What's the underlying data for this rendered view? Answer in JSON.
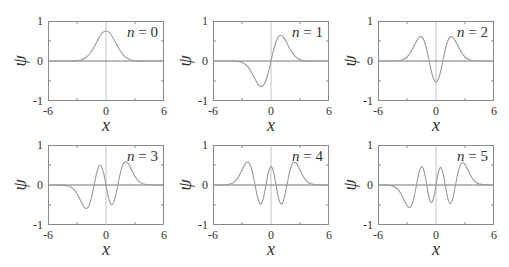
{
  "figure": {
    "x_label": "x",
    "y_label": "ψ",
    "x_tick_labels": [
      "-6",
      "0",
      "6"
    ],
    "y_tick_labels": [
      "1",
      "0",
      "-1"
    ]
  },
  "style": {
    "curve_color": "#9a9a9a",
    "frame_color": "#8a8a8a",
    "zero_line_color": "#777777",
    "vertical_axis_color": "#c4c4c4",
    "tick_color": "#8a8a8a"
  },
  "chart_data": [
    {
      "type": "line",
      "title": "n = 0",
      "label_var": "n",
      "label_rest": " = 0",
      "xlabel": "x",
      "ylabel": "ψ",
      "xlim": [
        -6,
        6
      ],
      "ylim": [
        -1,
        1
      ],
      "xticks": [
        -6,
        0,
        6
      ],
      "yticks": [
        -1,
        0,
        1
      ],
      "grid": false,
      "x": [
        -6,
        -5.5,
        -5,
        -4.5,
        -4,
        -3.75,
        -3.5,
        -3.25,
        -3,
        -2.75,
        -2.5,
        -2.25,
        -2,
        -1.75,
        -1.5,
        -1.25,
        -1,
        -0.75,
        -0.5,
        -0.25,
        0,
        0.25,
        0.5,
        0.75,
        1,
        1.25,
        1.5,
        1.75,
        2,
        2.25,
        2.5,
        2.75,
        3,
        3.25,
        3.5,
        3.75,
        4,
        4.5,
        5,
        5.5,
        6
      ],
      "values": [
        0,
        0,
        0,
        0,
        0,
        0.001,
        0.002,
        0.004,
        0.008,
        0.017,
        0.033,
        0.06,
        0.102,
        0.162,
        0.244,
        0.344,
        0.456,
        0.567,
        0.663,
        0.728,
        0.751,
        0.728,
        0.663,
        0.567,
        0.456,
        0.344,
        0.244,
        0.162,
        0.102,
        0.06,
        0.033,
        0.017,
        0.008,
        0.004,
        0.002,
        0.001,
        0,
        0,
        0,
        0,
        0
      ]
    },
    {
      "type": "line",
      "title": "n = 1",
      "label_var": "n",
      "label_rest": " = 1",
      "xlabel": "x",
      "ylabel": "ψ",
      "xlim": [
        -6,
        6
      ],
      "ylim": [
        -1,
        1
      ],
      "xticks": [
        -6,
        0,
        6
      ],
      "yticks": [
        -1,
        0,
        1
      ],
      "grid": false,
      "x": [
        -6,
        -5.5,
        -5,
        -4.5,
        -4,
        -3.75,
        -3.5,
        -3.25,
        -3,
        -2.75,
        -2.5,
        -2.25,
        -2,
        -1.75,
        -1.5,
        -1.25,
        -1,
        -0.75,
        -0.5,
        -0.25,
        0,
        0.25,
        0.5,
        0.75,
        1,
        1.25,
        1.5,
        1.75,
        2,
        2.25,
        2.5,
        2.75,
        3,
        3.25,
        3.5,
        3.75,
        4,
        4.5,
        5,
        5.5,
        6
      ],
      "values": [
        0,
        0,
        0,
        0,
        -0.001,
        -0.004,
        -0.008,
        -0.018,
        -0.035,
        -0.067,
        -0.117,
        -0.19,
        -0.287,
        -0.402,
        -0.517,
        -0.608,
        -0.644,
        -0.601,
        -0.469,
        -0.257,
        0,
        0.257,
        0.469,
        0.601,
        0.644,
        0.608,
        0.517,
        0.402,
        0.287,
        0.19,
        0.117,
        0.067,
        0.035,
        0.018,
        0.008,
        0.004,
        0.001,
        0,
        0,
        0,
        0
      ]
    },
    {
      "type": "line",
      "title": "n = 2",
      "label_var": "n",
      "label_rest": " = 2",
      "xlabel": "x",
      "ylabel": "ψ",
      "xlim": [
        -6,
        6
      ],
      "ylim": [
        -1,
        1
      ],
      "xticks": [
        -6,
        0,
        6
      ],
      "yticks": [
        -1,
        0,
        1
      ],
      "grid": false,
      "x": [
        -6,
        -5.5,
        -5,
        -4.5,
        -4,
        -3.75,
        -3.5,
        -3.25,
        -3,
        -2.75,
        -2.5,
        -2.25,
        -2,
        -1.75,
        -1.5,
        -1.25,
        -1,
        -0.75,
        -0.5,
        -0.25,
        0,
        0.25,
        0.5,
        0.75,
        1,
        1.25,
        1.5,
        1.75,
        2,
        2.25,
        2.5,
        2.75,
        3,
        3.25,
        3.5,
        3.75,
        4,
        4.5,
        5,
        5.5,
        6
      ],
      "values": [
        0,
        0,
        0,
        0.001,
        0.006,
        0.013,
        0.027,
        0.054,
        0.1,
        0.171,
        0.268,
        0.386,
        0.503,
        0.589,
        0.604,
        0.517,
        0.322,
        0.05,
        -0.234,
        -0.451,
        -0.531,
        -0.451,
        -0.234,
        0.05,
        0.322,
        0.517,
        0.604,
        0.589,
        0.503,
        0.386,
        0.268,
        0.171,
        0.1,
        0.054,
        0.027,
        0.013,
        0.006,
        0.001,
        0,
        0,
        0
      ]
    },
    {
      "type": "line",
      "title": "n = 3",
      "label_var": "n",
      "label_rest": " = 3",
      "xlabel": "x",
      "ylabel": "ψ",
      "xlim": [
        -6,
        6
      ],
      "ylim": [
        -1,
        1
      ],
      "xticks": [
        -6,
        0,
        6
      ],
      "yticks": [
        -1,
        0,
        1
      ],
      "grid": false,
      "x": [
        -6,
        -5.5,
        -5,
        -4.5,
        -4,
        -3.75,
        -3.5,
        -3.25,
        -3,
        -2.75,
        -2.5,
        -2.25,
        -2,
        -1.75,
        -1.5,
        -1.25,
        -1,
        -0.75,
        -0.5,
        -0.25,
        0,
        0.25,
        0.5,
        0.75,
        1,
        1.25,
        1.5,
        1.75,
        2,
        2.25,
        2.5,
        2.75,
        3,
        3.25,
        3.5,
        3.75,
        4,
        4.5,
        5,
        5.5,
        6
      ],
      "values": [
        0,
        0,
        0,
        -0.003,
        -0.017,
        -0.036,
        -0.071,
        -0.13,
        -0.217,
        -0.33,
        -0.453,
        -0.553,
        -0.587,
        -0.513,
        -0.317,
        -0.031,
        0.263,
        0.46,
        0.478,
        0.302,
        0,
        -0.302,
        -0.478,
        -0.46,
        -0.263,
        0.031,
        0.317,
        0.513,
        0.587,
        0.553,
        0.453,
        0.33,
        0.217,
        0.13,
        0.071,
        0.036,
        0.017,
        0.003,
        0,
        0,
        0
      ]
    },
    {
      "type": "line",
      "title": "n = 4",
      "label_var": "n",
      "label_rest": " = 4",
      "xlabel": "x",
      "ylabel": "ψ",
      "xlim": [
        -6,
        6
      ],
      "ylim": [
        -1,
        1
      ],
      "xticks": [
        -6,
        0,
        6
      ],
      "yticks": [
        -1,
        0,
        1
      ],
      "grid": false,
      "x": [
        -6,
        -5.5,
        -5,
        -4.5,
        -4,
        -3.75,
        -3.5,
        -3.25,
        -3,
        -2.75,
        -2.5,
        -2.25,
        -2,
        -1.75,
        -1.5,
        -1.25,
        -1,
        -0.75,
        -0.5,
        -0.25,
        0,
        0.25,
        0.5,
        0.75,
        1,
        1.25,
        1.5,
        1.75,
        2,
        2.25,
        2.5,
        2.75,
        3,
        3.25,
        3.5,
        3.75,
        4,
        4.5,
        5,
        5.5,
        6
      ],
      "values": [
        0,
        0,
        0.001,
        0.009,
        0.043,
        0.085,
        0.153,
        0.252,
        0.373,
        0.493,
        0.568,
        0.546,
        0.394,
        0.125,
        -0.187,
        -0.42,
        -0.465,
        -0.288,
        0.034,
        0.337,
        0.46,
        0.337,
        0.034,
        -0.288,
        -0.465,
        -0.42,
        -0.187,
        0.125,
        0.394,
        0.546,
        0.568,
        0.493,
        0.373,
        0.252,
        0.153,
        0.085,
        0.043,
        0.009,
        0.001,
        0,
        0
      ]
    },
    {
      "type": "line",
      "title": "n = 5",
      "label_var": "n",
      "label_rest": " = 5",
      "xlabel": "x",
      "ylabel": "ψ",
      "xlim": [
        -6,
        6
      ],
      "ylim": [
        -1,
        1
      ],
      "xticks": [
        -6,
        0,
        6
      ],
      "yticks": [
        -1,
        0,
        1
      ],
      "grid": false,
      "x": [
        -6,
        -5.5,
        -5,
        -4.5,
        -4,
        -3.75,
        -3.5,
        -3.25,
        -3,
        -2.75,
        -2.5,
        -2.25,
        -2,
        -1.75,
        -1.5,
        -1.25,
        -1,
        -0.75,
        -0.5,
        -0.25,
        0,
        0.25,
        0.5,
        0.75,
        1,
        1.25,
        1.5,
        1.75,
        2,
        2.25,
        2.5,
        2.75,
        3,
        3.25,
        3.5,
        3.75,
        4,
        4.5,
        5,
        5.5,
        6
      ],
      "values": [
        0,
        0,
        -0.004,
        -0.022,
        -0.094,
        -0.169,
        -0.275,
        -0.401,
        -0.514,
        -0.562,
        -0.493,
        -0.282,
        0.026,
        0.321,
        0.46,
        0.36,
        0.059,
        -0.275,
        -0.439,
        -0.323,
        0,
        0.323,
        0.439,
        0.275,
        -0.059,
        -0.36,
        -0.46,
        -0.321,
        -0.026,
        0.282,
        0.493,
        0.562,
        0.514,
        0.401,
        0.275,
        0.169,
        0.094,
        0.022,
        0.004,
        0,
        0
      ]
    }
  ]
}
